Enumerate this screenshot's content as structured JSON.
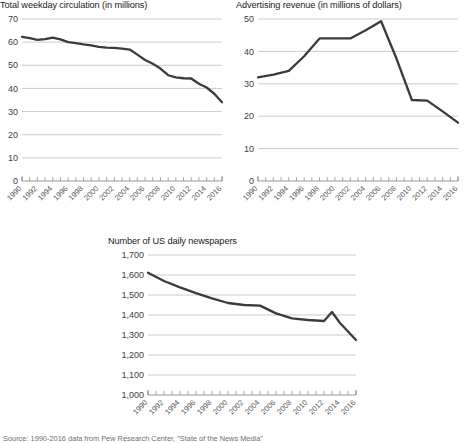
{
  "footer": {
    "source_text": "Source: 1990-2016 data from Pew Research Center, \"State of the News Media\""
  },
  "charts": [
    {
      "id": "weekday-circulation",
      "title": "Total weekday circulation (in millions)"
    },
    {
      "id": "advertising-revenue",
      "title": "Advertising revenue (in millions of dollars)"
    },
    {
      "id": "daily-newspapers",
      "title": "Number of US daily newspapers"
    }
  ],
  "chart_data": [
    {
      "type": "line",
      "title": "Total weekday circulation (in millions)",
      "xlabel": "",
      "ylabel": "",
      "xlim": [
        1990,
        2016
      ],
      "ylim": [
        0,
        70
      ],
      "yticks": [
        0,
        10,
        20,
        30,
        40,
        50,
        60,
        70
      ],
      "ytick_labels": [
        "0",
        "10",
        "20",
        "30",
        "40",
        "50",
        "60",
        "70"
      ],
      "xticks": [
        1990,
        1992,
        1994,
        1996,
        1998,
        2000,
        2002,
        2004,
        2006,
        2008,
        2010,
        2012,
        2014,
        2016
      ],
      "xtick_labels": [
        "1990",
        "1992",
        "1994",
        "1996",
        "1998",
        "2000",
        "2002",
        "2004",
        "2006",
        "2008",
        "2010",
        "2012",
        "2014",
        "2016"
      ],
      "grid": true,
      "legend": "none",
      "x": [
        1990,
        1991,
        1992,
        1993,
        1994,
        1995,
        1996,
        1997,
        1998,
        1999,
        2000,
        2001,
        2002,
        2003,
        2004,
        2005,
        2006,
        2007,
        2008,
        2009,
        2010,
        2011,
        2012,
        2013,
        2014,
        2015,
        2016
      ],
      "values": [
        62.3,
        61.7,
        61.0,
        61.3,
        62.0,
        61.2,
        60.0,
        59.6,
        59.0,
        58.6,
        58.0,
        57.6,
        57.5,
        57.2,
        56.8,
        54.6,
        52.3,
        50.7,
        48.6,
        45.7,
        44.8,
        44.4,
        44.3,
        42.0,
        40.4,
        37.7,
        34.0
      ]
    },
    {
      "type": "line",
      "title": "Advertising revenue (in millions of dollars)",
      "xlabel": "",
      "ylabel": "",
      "xlim": [
        1990,
        2016
      ],
      "ylim": [
        0,
        50
      ],
      "yticks": [
        0,
        10,
        20,
        30,
        40,
        50
      ],
      "ytick_labels": [
        "0",
        "10",
        "20",
        "30",
        "40",
        "50"
      ],
      "xticks": [
        1990,
        1992,
        1994,
        1996,
        1998,
        2000,
        2002,
        2004,
        2006,
        2008,
        2010,
        2012,
        2014,
        2016
      ],
      "xtick_labels": [
        "1990",
        "1992",
        "1994",
        "1996",
        "1998",
        "2000",
        "2002",
        "2004",
        "2006",
        "2008",
        "2010",
        "2012",
        "2014",
        "2016"
      ],
      "grid": true,
      "legend": "none",
      "x": [
        1990,
        1992,
        1994,
        1996,
        1998,
        2000,
        2002,
        2004,
        2006,
        2008,
        2010,
        2012,
        2014,
        2016
      ],
      "values": [
        32.0,
        32.8,
        34.0,
        38.5,
        44.0,
        44.0,
        44.0,
        46.5,
        49.3,
        37.8,
        25.0,
        24.8,
        21.5,
        18.0
      ]
    },
    {
      "type": "line",
      "title": "Number of US daily newspapers",
      "xlabel": "",
      "ylabel": "",
      "xlim": [
        1990,
        2016
      ],
      "ylim": [
        1000,
        1700
      ],
      "yticks": [
        1000,
        1100,
        1200,
        1300,
        1400,
        1500,
        1600,
        1700
      ],
      "ytick_labels": [
        "1,000",
        "1,100",
        "1,200",
        "1,300",
        "1,400",
        "1,500",
        "1,600",
        "1,700"
      ],
      "xticks": [
        1990,
        1992,
        1994,
        1996,
        1998,
        2000,
        2002,
        2004,
        2006,
        2008,
        2010,
        2012,
        2014,
        2016
      ],
      "xtick_labels": [
        "1990",
        "1992",
        "1994",
        "1996",
        "1998",
        "2000",
        "2002",
        "2004",
        "2006",
        "2008",
        "2010",
        "2012",
        "2014",
        "2016"
      ],
      "grid": true,
      "legend": "none",
      "x": [
        1990,
        1992,
        1994,
        1996,
        1998,
        2000,
        2002,
        2004,
        2006,
        2008,
        2010,
        2012,
        2013,
        2014,
        2016
      ],
      "values": [
        1611,
        1570,
        1538,
        1509,
        1483,
        1460,
        1450,
        1447,
        1408,
        1383,
        1375,
        1370,
        1415,
        1360,
        1275
      ]
    }
  ]
}
